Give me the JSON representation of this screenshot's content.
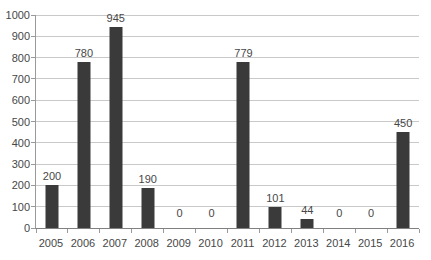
{
  "chart_data": {
    "type": "bar",
    "title": "",
    "xlabel": "",
    "ylabel": "",
    "categories": [
      "2005",
      "2006",
      "2007",
      "2008",
      "2009",
      "2010",
      "2011",
      "2012",
      "2013",
      "2014",
      "2015",
      "2016"
    ],
    "values": [
      200,
      780,
      945,
      190,
      0,
      0,
      779,
      101,
      44,
      0,
      0,
      450
    ],
    "data_labels": [
      "200",
      "780",
      "945",
      "190",
      "0",
      "0",
      "779",
      "101",
      "44",
      "0",
      "0",
      "450"
    ],
    "ytick_labels": [
      "0",
      "100",
      "200",
      "300",
      "400",
      "500",
      "600",
      "700",
      "800",
      "900",
      "1000"
    ],
    "ylim": [
      0,
      1000
    ],
    "ytick_interval": 100,
    "grid": true,
    "legend": false,
    "colors": {
      "bar": "#3a3a3a",
      "gridline": "#c9c9c9",
      "axis": "#9a9a9a",
      "text": "#474747",
      "background": "#ffffff"
    }
  }
}
